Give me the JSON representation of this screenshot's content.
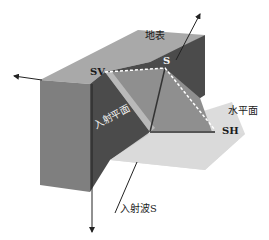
{
  "diagram": {
    "labels": {
      "surface": "地表",
      "sv": "SV",
      "s": "S",
      "sh": "SH",
      "horizontal_plane": "水平面",
      "incidence_plane": "入射平面",
      "incident_wave": "入射波S"
    },
    "colors": {
      "top_face": "#a8a8a8",
      "front_face": "#808080",
      "dark_face": "#4a4a4a",
      "wedge_face": "#8e8e8e",
      "wedge_edge": "#b8b8b8",
      "horizontal_plane": "#d4d4d4",
      "arrow": "#222222",
      "dashed_line": "#ffffff"
    }
  }
}
